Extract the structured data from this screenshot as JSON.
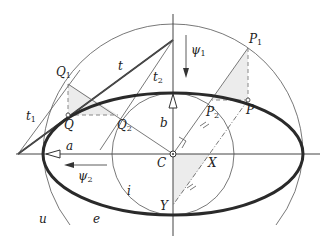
{
  "diagram": {
    "colors": {
      "ellipse": "#2a2a2a",
      "thin_line": "#555555",
      "dashed": "#888888",
      "shade": "#ececec",
      "background": "#ffffff"
    },
    "labels": {
      "Q1": {
        "main": "Q",
        "sub": "1"
      },
      "Q": {
        "main": "Q"
      },
      "Q2": {
        "main": "Q",
        "sub": "2"
      },
      "P1": {
        "main": "P",
        "sub": "1"
      },
      "P": {
        "main": "P"
      },
      "P2": {
        "main": "P",
        "sub": "2"
      },
      "t": {
        "main": "t"
      },
      "t1": {
        "main": "t",
        "sub": "1"
      },
      "t2": {
        "main": "t",
        "sub": "2"
      },
      "psi1": {
        "main": "ψ",
        "sub": "1"
      },
      "psi2": {
        "main": "ψ",
        "sub": "2"
      },
      "a": {
        "main": "a"
      },
      "b": {
        "main": "b"
      },
      "C": {
        "main": "C"
      },
      "X": {
        "main": "X"
      },
      "Y": {
        "main": "Y"
      },
      "i": {
        "main": "i"
      },
      "u": {
        "main": "u"
      },
      "e": {
        "main": "e"
      }
    },
    "geometry": {
      "center": [
        173,
        154
      ],
      "semi_major_a": 130,
      "semi_minor_b": 61,
      "outer_circle_radius": 130,
      "inner_circle_radius": 61
    }
  }
}
